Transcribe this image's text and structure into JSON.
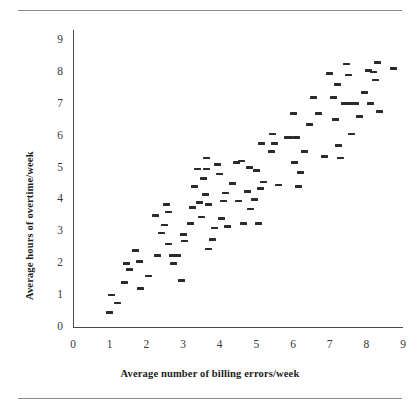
{
  "chart_data": {
    "type": "scatter",
    "title": "",
    "xlabel": "Average number of billing errors/week",
    "ylabel": "Average hours of overtime/week",
    "xlim": [
      0,
      9
    ],
    "ylim": [
      0,
      9
    ],
    "xticks": [
      0,
      1,
      2,
      3,
      4,
      5,
      6,
      7,
      8,
      9
    ],
    "yticks": [
      0,
      1,
      2,
      3,
      4,
      5,
      6,
      7,
      8,
      9
    ],
    "grid": false,
    "legend": null,
    "marker_style": "horizontal-dash",
    "marker_color": "#2a2a2a",
    "points": [
      [
        1.0,
        0.45
      ],
      [
        1.05,
        1.0
      ],
      [
        1.2,
        0.75
      ],
      [
        1.4,
        1.4
      ],
      [
        1.45,
        2.0
      ],
      [
        1.55,
        1.8
      ],
      [
        1.7,
        2.4
      ],
      [
        1.8,
        2.05
      ],
      [
        1.85,
        1.2
      ],
      [
        2.05,
        1.6
      ],
      [
        2.25,
        3.5
      ],
      [
        2.3,
        2.25
      ],
      [
        2.4,
        2.95
      ],
      [
        2.5,
        3.2
      ],
      [
        2.55,
        3.85
      ],
      [
        2.6,
        3.6
      ],
      [
        2.6,
        2.6
      ],
      [
        2.7,
        2.25
      ],
      [
        2.75,
        2.0
      ],
      [
        2.85,
        2.25
      ],
      [
        2.95,
        1.45
      ],
      [
        3.0,
        2.9
      ],
      [
        3.05,
        2.7
      ],
      [
        3.2,
        3.25
      ],
      [
        3.25,
        3.75
      ],
      [
        3.3,
        4.4
      ],
      [
        3.4,
        4.95
      ],
      [
        3.45,
        3.9
      ],
      [
        3.5,
        3.45
      ],
      [
        3.55,
        4.65
      ],
      [
        3.6,
        4.15
      ],
      [
        3.65,
        5.3
      ],
      [
        3.65,
        4.95
      ],
      [
        3.7,
        3.85
      ],
      [
        3.7,
        2.45
      ],
      [
        3.8,
        2.75
      ],
      [
        3.85,
        3.1
      ],
      [
        3.95,
        5.1
      ],
      [
        4.0,
        4.8
      ],
      [
        4.05,
        3.4
      ],
      [
        4.1,
        3.95
      ],
      [
        4.15,
        4.2
      ],
      [
        4.2,
        3.15
      ],
      [
        4.35,
        4.5
      ],
      [
        4.45,
        5.15
      ],
      [
        4.5,
        3.95
      ],
      [
        4.6,
        5.2
      ],
      [
        4.65,
        3.25
      ],
      [
        4.75,
        4.25
      ],
      [
        4.8,
        5.0
      ],
      [
        4.85,
        3.7
      ],
      [
        4.95,
        4.0
      ],
      [
        5.0,
        4.9
      ],
      [
        5.05,
        3.25
      ],
      [
        5.1,
        4.35
      ],
      [
        5.15,
        5.75
      ],
      [
        5.2,
        4.55
      ],
      [
        5.4,
        5.5
      ],
      [
        5.45,
        6.05
      ],
      [
        5.5,
        5.75
      ],
      [
        5.6,
        4.45
      ],
      [
        5.85,
        5.95
      ],
      [
        5.9,
        5.95
      ],
      [
        6.0,
        6.7
      ],
      [
        6.05,
        5.15
      ],
      [
        6.1,
        5.95
      ],
      [
        6.15,
        4.4
      ],
      [
        6.2,
        4.85
      ],
      [
        6.3,
        5.5
      ],
      [
        6.45,
        6.35
      ],
      [
        6.55,
        7.2
      ],
      [
        6.7,
        6.7
      ],
      [
        6.85,
        5.35
      ],
      [
        7.0,
        7.95
      ],
      [
        7.1,
        7.2
      ],
      [
        7.15,
        6.5
      ],
      [
        7.2,
        7.6
      ],
      [
        7.25,
        5.7
      ],
      [
        7.3,
        5.3
      ],
      [
        7.4,
        7.0
      ],
      [
        7.45,
        8.25
      ],
      [
        7.5,
        7.9
      ],
      [
        7.55,
        7.0
      ],
      [
        7.6,
        6.05
      ],
      [
        7.7,
        7.0
      ],
      [
        7.8,
        6.6
      ],
      [
        7.95,
        7.35
      ],
      [
        8.05,
        8.05
      ],
      [
        8.1,
        7.0
      ],
      [
        8.2,
        8.0
      ],
      [
        8.25,
        7.75
      ],
      [
        8.3,
        8.3
      ],
      [
        8.35,
        6.75
      ],
      [
        8.75,
        8.1
      ]
    ]
  }
}
